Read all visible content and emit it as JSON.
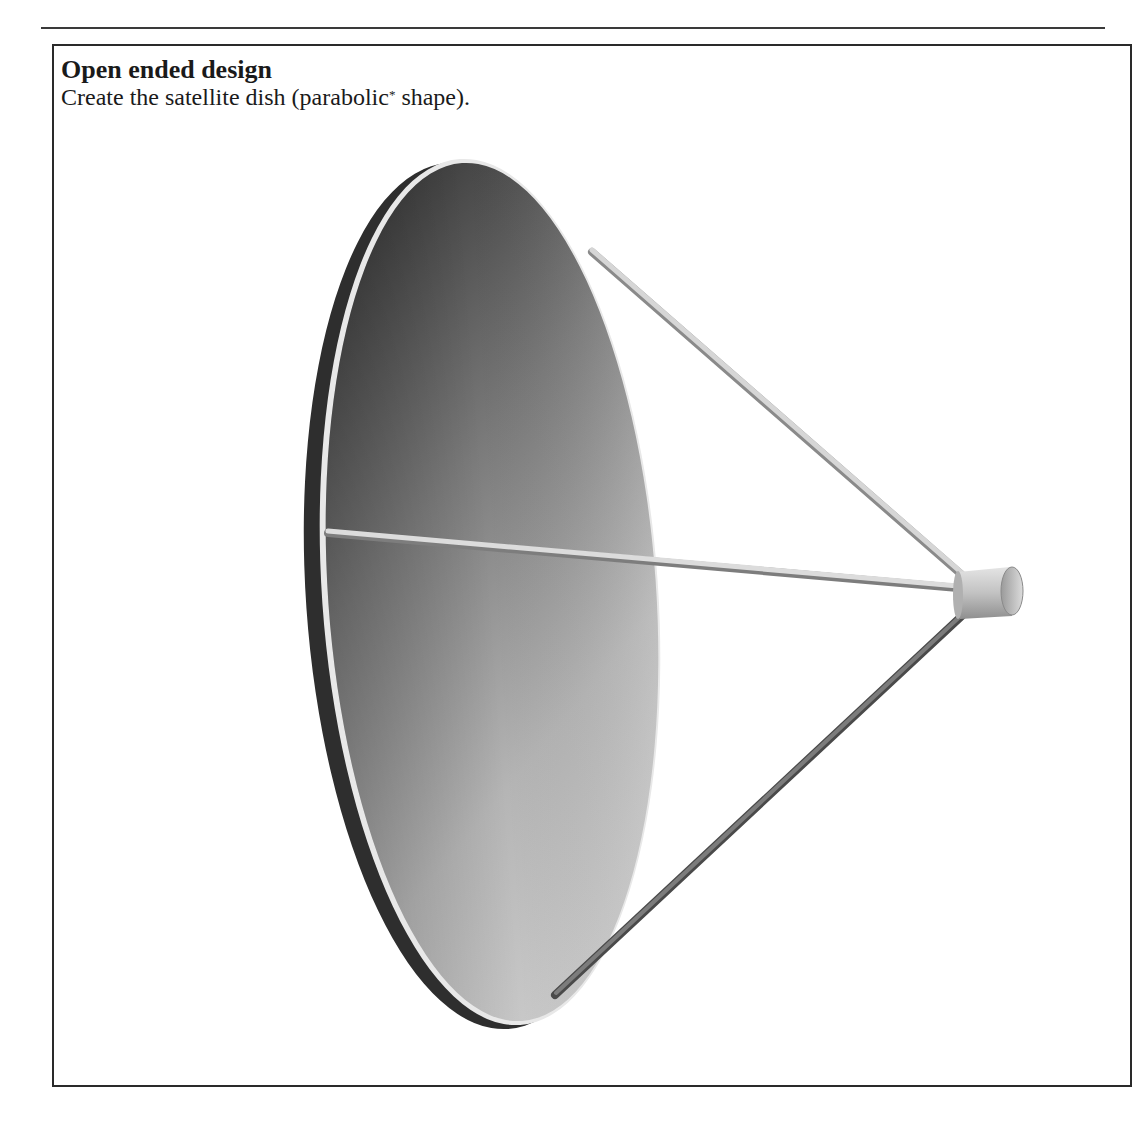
{
  "header": {
    "title": "Open ended design",
    "instruction_before": "Create the satellite dish (parabolic",
    "footnote_marker": "*",
    "instruction_after": " shape)."
  },
  "figure": {
    "parts": [
      "parabolic-dish",
      "upper-strut",
      "center-strut",
      "lower-strut",
      "feed-horn-cylinder"
    ],
    "colors": {
      "dish_dark": "#3c3c3c",
      "dish_light": "#c9c9c9",
      "rim": "#e6e6e6",
      "backside": "#2e2e2e",
      "strut": "#cfcfcf",
      "lower_strut": "#6a6a6a",
      "feed": "#bdbdbd"
    }
  }
}
